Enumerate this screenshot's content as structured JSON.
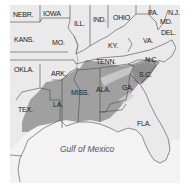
{
  "colors": {
    "land": "#e8e8e8",
    "land_light": "#f0f0f0",
    "water": "#f2f2f2",
    "shaded_region": "#9a9a9a",
    "border": "#4a4a4a",
    "background": "#ffffff"
  },
  "map": {
    "title": "",
    "water_label": "Gulf of Mexico",
    "states": [
      {
        "id": "nebr",
        "label": "NEBR."
      },
      {
        "id": "iowa",
        "label": "IOWA"
      },
      {
        "id": "ill",
        "label": "ILL."
      },
      {
        "id": "ind",
        "label": "IND."
      },
      {
        "id": "ohio",
        "label": "OHIO"
      },
      {
        "id": "pa",
        "label": "PA."
      },
      {
        "id": "nj",
        "label": "N.J."
      },
      {
        "id": "md",
        "label": "MD."
      },
      {
        "id": "del",
        "label": "DEL."
      },
      {
        "id": "kans",
        "label": "KANS."
      },
      {
        "id": "mo",
        "label": "MO."
      },
      {
        "id": "ky",
        "label": "KY."
      },
      {
        "id": "va",
        "label": "VA."
      },
      {
        "id": "okla",
        "label": "OKLA."
      },
      {
        "id": "ark",
        "label": "ARK."
      },
      {
        "id": "tenn",
        "label": "TENN."
      },
      {
        "id": "nc",
        "label": "N.C."
      },
      {
        "id": "sc",
        "label": "S.C."
      },
      {
        "id": "tex",
        "label": "TEX."
      },
      {
        "id": "la",
        "label": "LA."
      },
      {
        "id": "miss",
        "label": "MISS."
      },
      {
        "id": "ala",
        "label": "ALA."
      },
      {
        "id": "ga",
        "label": "GA."
      },
      {
        "id": "fla",
        "label": "FLA."
      }
    ],
    "shaded_states": [
      "S.C.",
      "GA.",
      "ALA.",
      "MISS.",
      "LA.",
      "ARK.",
      "TEX."
    ]
  }
}
